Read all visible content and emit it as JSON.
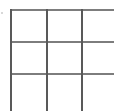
{
  "canvas": {
    "width": 114,
    "height": 111,
    "background_color": "#ffffff",
    "description": "Cropped 3x3 grid of empty cells"
  },
  "grid": {
    "rows": 3,
    "columns": 3,
    "horizontal_line_color": "#7d7d7d",
    "vertical_line_color": "#595959",
    "line_thickness": 2,
    "clipped_right": true,
    "clipped_bottom": true,
    "horizontal_lines": [
      {
        "name": "top-rule",
        "y": 9,
        "x_start": 10,
        "x_end": 114
      },
      {
        "name": "middle-rule",
        "y": 41,
        "x_start": 10,
        "x_end": 114
      },
      {
        "name": "lower-rule",
        "y": 73,
        "x_start": 10,
        "x_end": 114
      }
    ],
    "vertical_lines": [
      {
        "name": "left-rule",
        "x": 10,
        "y_start": 9,
        "y_end": 111
      },
      {
        "name": "inner-rule",
        "x": 46,
        "y_start": 9,
        "y_end": 111
      },
      {
        "name": "right-inner-rule",
        "x": 81,
        "y_start": 9,
        "y_end": 111
      }
    ],
    "cells": [
      {
        "name": "cell-r1c1",
        "value": "",
        "x": 12,
        "y": 11,
        "width": 34,
        "height": 30
      },
      {
        "name": "cell-r1c2",
        "value": "",
        "x": 48,
        "y": 11,
        "width": 33,
        "height": 30
      },
      {
        "name": "cell-r1c3",
        "value": "",
        "x": 83,
        "y": 11,
        "width": 31,
        "height": 30
      },
      {
        "name": "cell-r2c1",
        "value": "",
        "x": 12,
        "y": 43,
        "width": 34,
        "height": 30
      },
      {
        "name": "cell-r2c2",
        "value": "",
        "x": 48,
        "y": 43,
        "width": 33,
        "height": 30
      },
      {
        "name": "cell-r2c3",
        "value": "",
        "x": 83,
        "y": 43,
        "width": 31,
        "height": 30
      },
      {
        "name": "cell-r3c1",
        "value": "",
        "x": 12,
        "y": 75,
        "width": 34,
        "height": 36
      },
      {
        "name": "cell-r3c2",
        "value": "",
        "x": 48,
        "y": 75,
        "width": 33,
        "height": 36
      },
      {
        "name": "cell-r3c3",
        "value": "",
        "x": 83,
        "y": 75,
        "width": 31,
        "height": 36
      }
    ]
  },
  "artifacts": [
    {
      "name": "edge-speck",
      "x": 1,
      "y": 12,
      "color": "#d8d8d8"
    }
  ]
}
